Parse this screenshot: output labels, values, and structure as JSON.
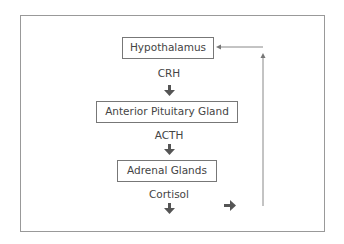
{
  "diagram": {
    "nodes": [
      {
        "id": "hypothalamus",
        "label": "Hypothalamus"
      },
      {
        "id": "anterior_pituitary",
        "label": "Anterior Pituitary Gland"
      },
      {
        "id": "adrenal",
        "label": "Adrenal Glands"
      }
    ],
    "hormones": [
      {
        "label": "CRH"
      },
      {
        "label": "ACTH"
      },
      {
        "label": "Cortisol"
      }
    ],
    "edges": [
      {
        "from": "hypothalamus",
        "to": "anterior_pituitary",
        "label": "CRH"
      },
      {
        "from": "anterior_pituitary",
        "to": "adrenal",
        "label": "ACTH"
      },
      {
        "from": "adrenal",
        "to": "output",
        "label": "Cortisol"
      },
      {
        "from": "cortisol",
        "to": "hypothalamus",
        "type": "feedback"
      }
    ],
    "colors": {
      "line": "#777777",
      "arrow": "#555555",
      "text": "#444444"
    }
  }
}
